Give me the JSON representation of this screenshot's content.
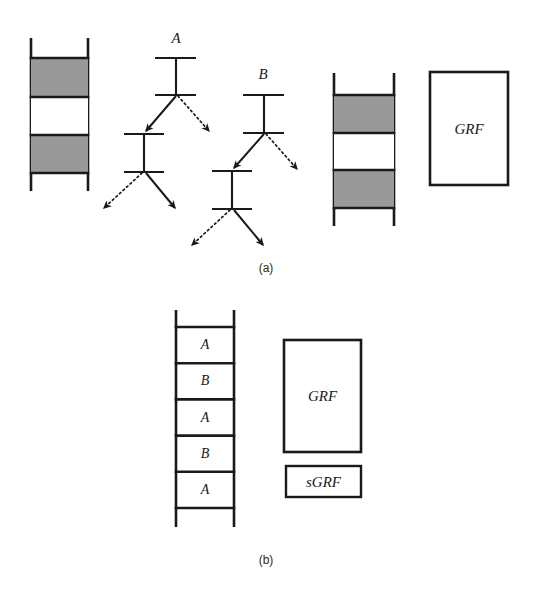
{
  "figure": {
    "background_color": "#ffffff",
    "stroke_color": "#1a1a1a",
    "band_fill_color": "#999999",
    "panels": [
      {
        "id": "a",
        "caption": "(a)",
        "caption_x": 266,
        "caption_y": 268
      },
      {
        "id": "b",
        "caption": "(b)",
        "caption_x": 266,
        "caption_y": 560
      }
    ]
  },
  "panel_a": {
    "left_ladder": {
      "name": "chromosome-left",
      "rail_left_x": 31,
      "rail_right_x": 88,
      "rail_top_y": 38,
      "rail_bottom_y": 191,
      "bands": [
        {
          "label": "",
          "fill": "#999999",
          "top": 58,
          "bottom": 97
        },
        {
          "label": "",
          "fill": "#ffffff",
          "top": 97,
          "bottom": 135
        },
        {
          "label": "",
          "fill": "#999999",
          "top": 135,
          "bottom": 173
        }
      ]
    },
    "tree_a": {
      "name": "lineage-tree-a",
      "label": "A",
      "label_x": 176,
      "label_y": 38,
      "nodes": [
        {
          "bar_y": 58,
          "bar_x1": 155,
          "bar_x2": 196,
          "stem_x": 176
        },
        {
          "bar_y": 95,
          "bar_x1": 155,
          "bar_x2": 196,
          "stem_x": 176
        },
        {
          "bar_y": 134,
          "bar_x1": 124,
          "bar_x2": 164,
          "stem_x": 144
        },
        {
          "bar_y": 172,
          "bar_x1": 124,
          "bar_x2": 164,
          "stem_x": 144
        }
      ],
      "edges": [
        {
          "style": "solid",
          "from_x": 176,
          "from_y": 96,
          "to_x": 146,
          "to_y": 131
        },
        {
          "style": "dotted",
          "from_x": 178,
          "from_y": 96,
          "to_x": 209,
          "to_y": 131
        },
        {
          "style": "dotted",
          "from_x": 142,
          "from_y": 173,
          "to_x": 104,
          "to_y": 208
        },
        {
          "style": "solid",
          "from_x": 146,
          "from_y": 173,
          "to_x": 175,
          "to_y": 208
        }
      ]
    },
    "tree_b": {
      "name": "lineage-tree-b",
      "label": "B",
      "label_x": 263,
      "label_y": 74,
      "nodes": [
        {
          "bar_y": 95,
          "bar_x1": 243,
          "bar_x2": 284,
          "stem_x": 264
        },
        {
          "bar_y": 133,
          "bar_x1": 243,
          "bar_x2": 284,
          "stem_x": 264
        },
        {
          "bar_y": 171,
          "bar_x1": 212,
          "bar_x2": 252,
          "stem_x": 232
        },
        {
          "bar_y": 209,
          "bar_x1": 212,
          "bar_x2": 252,
          "stem_x": 232
        }
      ],
      "edges": [
        {
          "style": "solid",
          "from_x": 264,
          "from_y": 134,
          "to_x": 234,
          "to_y": 168
        },
        {
          "style": "dotted",
          "from_x": 266,
          "from_y": 134,
          "to_x": 297,
          "to_y": 169
        },
        {
          "style": "dotted",
          "from_x": 230,
          "from_y": 210,
          "to_x": 192,
          "to_y": 245
        },
        {
          "style": "solid",
          "from_x": 234,
          "from_y": 210,
          "to_x": 263,
          "to_y": 245
        }
      ]
    },
    "right_ladder": {
      "name": "chromosome-right",
      "rail_left_x": 334,
      "rail_right_x": 394,
      "rail_top_y": 73,
      "rail_bottom_y": 226,
      "bands": [
        {
          "label": "",
          "fill": "#999999",
          "top": 95,
          "bottom": 133
        },
        {
          "label": "",
          "fill": "#ffffff",
          "top": 133,
          "bottom": 170
        },
        {
          "label": "",
          "fill": "#999999",
          "top": 170,
          "bottom": 208
        }
      ]
    },
    "grf_box": {
      "name": "grf-box-a",
      "label": "GRF",
      "x": 430,
      "y": 72,
      "width": 78,
      "height": 113
    }
  },
  "panel_b": {
    "ladder": {
      "name": "chromosome-labeled",
      "rail_left_x": 176,
      "rail_right_x": 234,
      "rail_top_y": 310,
      "rail_bottom_y": 527,
      "cell_top_y": 327,
      "cell_height": 36.2,
      "rungs": [
        {
          "label": "A"
        },
        {
          "label": "B"
        },
        {
          "label": "A"
        },
        {
          "label": "B"
        },
        {
          "label": "A"
        }
      ]
    },
    "grf_box": {
      "name": "grf-box-b",
      "label": "GRF",
      "x": 284,
      "y": 340,
      "width": 77,
      "height": 112
    },
    "sgrf_box": {
      "name": "sgrf-box",
      "label": "sGRF",
      "x": 286,
      "y": 466,
      "width": 75,
      "height": 31
    }
  }
}
